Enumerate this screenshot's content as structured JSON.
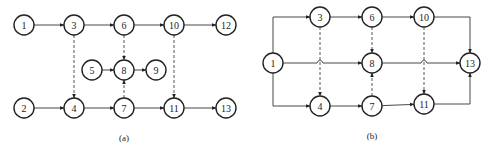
{
  "diagrams": [
    {
      "id": "a",
      "caption": "(a)",
      "nodes": [
        {
          "label": "1",
          "x": 24,
          "y": 25
        },
        {
          "label": "3",
          "x": 74,
          "y": 25
        },
        {
          "label": "6",
          "x": 124,
          "y": 25
        },
        {
          "label": "10",
          "x": 174,
          "y": 25
        },
        {
          "label": "12",
          "x": 226,
          "y": 25
        },
        {
          "label": "5",
          "x": 92,
          "y": 70
        },
        {
          "label": "8",
          "x": 124,
          "y": 70
        },
        {
          "label": "9",
          "x": 156,
          "y": 70
        },
        {
          "label": "2",
          "x": 24,
          "y": 108
        },
        {
          "label": "4",
          "x": 74,
          "y": 108
        },
        {
          "label": "7",
          "x": 124,
          "y": 108
        },
        {
          "label": "11",
          "x": 174,
          "y": 108
        },
        {
          "label": "13",
          "x": 226,
          "y": 108
        }
      ],
      "edges": [
        {
          "from": "1",
          "to": "3",
          "type": "solid"
        },
        {
          "from": "3",
          "to": "6",
          "type": "solid"
        },
        {
          "from": "6",
          "to": "10",
          "type": "solid"
        },
        {
          "from": "10",
          "to": "12",
          "type": "solid"
        },
        {
          "from": "5",
          "to": "8",
          "type": "solid"
        },
        {
          "from": "8",
          "to": "9",
          "type": "solid"
        },
        {
          "from": "2",
          "to": "4",
          "type": "solid"
        },
        {
          "from": "4",
          "to": "7",
          "type": "solid"
        },
        {
          "from": "7",
          "to": "11",
          "type": "solid"
        },
        {
          "from": "11",
          "to": "13",
          "type": "solid"
        },
        {
          "from": "3",
          "to": "4",
          "type": "dashed"
        },
        {
          "from": "6",
          "to": "8",
          "type": "dashed"
        },
        {
          "from": "7",
          "to": "8",
          "type": "dashed"
        },
        {
          "from": "10",
          "to": "11",
          "type": "dashed"
        }
      ]
    },
    {
      "id": "b",
      "caption": "(b)",
      "nodes": [
        {
          "label": "1",
          "x": 273,
          "y": 63
        },
        {
          "label": "3",
          "x": 320,
          "y": 17
        },
        {
          "label": "6",
          "x": 372,
          "y": 17
        },
        {
          "label": "10",
          "x": 424,
          "y": 17
        },
        {
          "label": "8",
          "x": 372,
          "y": 63
        },
        {
          "label": "13",
          "x": 470,
          "y": 63
        },
        {
          "label": "4",
          "x": 320,
          "y": 106
        },
        {
          "label": "7",
          "x": 372,
          "y": 106
        },
        {
          "label": "11",
          "x": 424,
          "y": 104
        }
      ],
      "edges": [
        {
          "from": "1",
          "to": "3",
          "type": "solid",
          "route": "up-right"
        },
        {
          "from": "1",
          "to": "8",
          "type": "solid",
          "route": "straight-with-hops"
        },
        {
          "from": "1",
          "to": "4",
          "type": "solid",
          "route": "down-right"
        },
        {
          "from": "3",
          "to": "6",
          "type": "solid"
        },
        {
          "from": "6",
          "to": "10",
          "type": "solid"
        },
        {
          "from": "10",
          "to": "13",
          "type": "solid",
          "route": "right-down"
        },
        {
          "from": "8",
          "to": "13",
          "type": "solid",
          "route": "straight-with-hops"
        },
        {
          "from": "4",
          "to": "7",
          "type": "solid"
        },
        {
          "from": "7",
          "to": "11",
          "type": "solid"
        },
        {
          "from": "11",
          "to": "13",
          "type": "solid",
          "route": "right-up"
        },
        {
          "from": "3",
          "to": "4",
          "type": "dashed"
        },
        {
          "from": "6",
          "to": "8",
          "type": "dashed"
        },
        {
          "from": "7",
          "to": "8",
          "type": "dashed"
        },
        {
          "from": "10",
          "to": "11",
          "type": "dashed"
        }
      ]
    }
  ],
  "style": {
    "node_radius": 10,
    "stroke_color": "#222222",
    "background": "#ffffff"
  }
}
